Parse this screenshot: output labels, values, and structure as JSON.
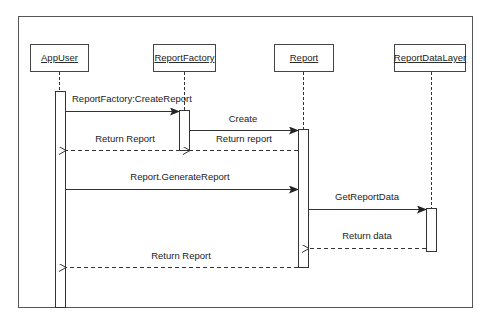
{
  "diagram": {
    "type": "sequence",
    "colors": {
      "line": "#333333",
      "background": "#ffffff",
      "text": "#222222"
    },
    "participants": [
      {
        "id": "appuser",
        "label": "AppUser"
      },
      {
        "id": "reportfactory",
        "label": "ReportFactory"
      },
      {
        "id": "report",
        "label": "Report"
      },
      {
        "id": "reportdatalayer",
        "label": "ReportDataLayer"
      }
    ],
    "messages": [
      {
        "from": "AppUser",
        "to": "ReportFactory",
        "label": "ReportFactory:CreateReport",
        "kind": "sync"
      },
      {
        "from": "ReportFactory",
        "to": "Report",
        "label": "Create",
        "kind": "sync"
      },
      {
        "from": "Report",
        "to": "ReportFactory",
        "label": "Return report",
        "kind": "return"
      },
      {
        "from": "ReportFactory",
        "to": "AppUser",
        "label": "Return Report",
        "kind": "return"
      },
      {
        "from": "AppUser",
        "to": "Report",
        "label": "Report.GenerateReport",
        "kind": "sync"
      },
      {
        "from": "Report",
        "to": "ReportDataLayer",
        "label": "GetReportData",
        "kind": "sync"
      },
      {
        "from": "ReportDataLayer",
        "to": "Report",
        "label": "Return data",
        "kind": "return"
      },
      {
        "from": "Report",
        "to": "AppUser",
        "label": "Return Report",
        "kind": "return"
      }
    ]
  }
}
